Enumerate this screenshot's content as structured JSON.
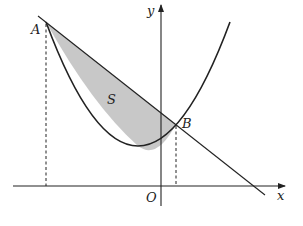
{
  "figure": {
    "colors": {
      "stroke": "#222222",
      "shade": "#c8c8c8",
      "background": "#ffffff"
    }
  },
  "labels": {
    "point_a": "A",
    "point_b": "B",
    "region": "S",
    "origin": "O",
    "x_axis": "x",
    "y_axis": "y"
  }
}
